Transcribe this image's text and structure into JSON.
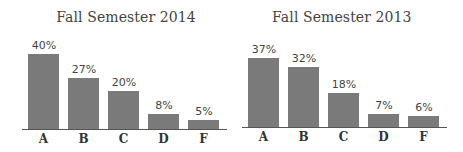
{
  "chart_data": [
    {
      "type": "bar",
      "title": "Fall Semester 2014",
      "categories": [
        "A",
        "B",
        "C",
        "D",
        "F"
      ],
      "values": [
        40,
        27,
        20,
        8,
        5
      ],
      "value_labels": [
        "40%",
        "27%",
        "20%",
        "8%",
        "5%"
      ],
      "xlabel": "",
      "ylabel": "",
      "ylim": [
        0,
        40
      ],
      "grid": false,
      "legend": null,
      "bar_color": "#7a7a7a"
    },
    {
      "type": "bar",
      "title": "Fall Semester 2013",
      "categories": [
        "A",
        "B",
        "C",
        "D",
        "F"
      ],
      "values": [
        37,
        32,
        18,
        7,
        6
      ],
      "value_labels": [
        "37%",
        "32%",
        "18%",
        "7%",
        "6%"
      ],
      "xlabel": "",
      "ylabel": "",
      "ylim": [
        0,
        40
      ],
      "grid": false,
      "legend": null,
      "bar_color": "#7a7a7a"
    }
  ]
}
